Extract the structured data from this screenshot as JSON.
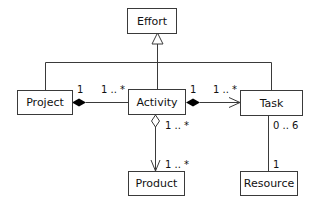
{
  "diagram": {
    "type": "uml-class-diagram",
    "classes": {
      "effort": "Effort",
      "project": "Project",
      "activity": "Activity",
      "task": "Task",
      "product": "Product",
      "resource": "Resource"
    },
    "relationships": [
      {
        "type": "generalization",
        "from": [
          "Project",
          "Activity",
          "Task"
        ],
        "to": "Effort"
      },
      {
        "type": "composition",
        "whole": "Project",
        "part": "Activity",
        "whole_mult": "1",
        "part_mult": "1 .. *"
      },
      {
        "type": "composition",
        "whole": "Activity",
        "part": "Task",
        "whole_mult": "1",
        "part_mult": "1 .. *",
        "navigable": true
      },
      {
        "type": "aggregation",
        "whole": "Activity",
        "part": "Product",
        "whole_mult": "1 .. *",
        "part_mult": "1 .. *",
        "navigable": true
      },
      {
        "type": "association",
        "from": "Task",
        "to": "Resource",
        "from_mult": "0 .. 6",
        "to_mult": "1"
      }
    ],
    "multiplicities": {
      "project_activity_project": "1",
      "project_activity_activity": "1 .. *",
      "activity_task_activity": "1",
      "activity_task_task": "1 .. *",
      "activity_product_activity": "1 .. *",
      "activity_product_product": "1 .. *",
      "task_resource_task": "0 .. 6",
      "task_resource_resource": "1"
    },
    "colors": {
      "line": "#3a3a3a",
      "background": "#ffffff",
      "text": "#111111"
    }
  }
}
